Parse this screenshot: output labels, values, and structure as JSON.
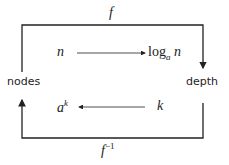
{
  "nodes": {
    "left": "nodes",
    "right": "depth"
  },
  "top_arrow": {
    "label": "f"
  },
  "bottom_arrow": {
    "label_base": "f",
    "label_sup": "−1"
  },
  "inner_top": {
    "from": "n",
    "to_fn": "log",
    "to_sub": "a",
    "to_arg": "n"
  },
  "inner_bottom": {
    "from": "k",
    "to_base": "a",
    "to_sup": "k"
  },
  "colors": {
    "line": "#222222"
  }
}
